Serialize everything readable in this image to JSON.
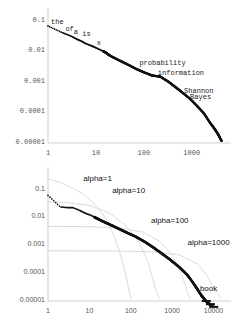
{
  "chart_data": [
    {
      "id": "top",
      "type": "scatter",
      "title": "",
      "xlabel": "",
      "ylabel": "",
      "xscale": "log",
      "yscale": "log",
      "xlim": [
        1,
        6000
      ],
      "ylim": [
        1e-05,
        0.2
      ],
      "grid": false,
      "legend": "none",
      "xticks": [
        "1",
        "10",
        "100",
        "1000"
      ],
      "xtick_values": [
        1,
        10,
        100,
        1000
      ],
      "yticks": [
        "0.1",
        "0.01",
        "0.001",
        "0.0001",
        "0.00001"
      ],
      "ytick_values": [
        0.1,
        0.01,
        0.001,
        0.0001,
        1e-05
      ],
      "series": [
        {
          "name": "word-frequency",
          "x": [
            1,
            2,
            3,
            4,
            5,
            6,
            8,
            10,
            13,
            16,
            20,
            30,
            45,
            70,
            100,
            150,
            220,
            320,
            450,
            600,
            900,
            1300,
            1800,
            2400,
            3000,
            3600,
            4200
          ],
          "values": [
            0.06,
            0.036,
            0.028,
            0.022,
            0.019,
            0.016,
            0.0135,
            0.0115,
            0.0095,
            0.008,
            0.0062,
            0.0045,
            0.0033,
            0.0023,
            0.0018,
            0.0014,
            0.0013,
            0.0009,
            0.0006,
            0.00042,
            0.00025,
            0.00014,
            8e-05,
            4e-05,
            2.5e-05,
            1.6e-05,
            1e-05
          ]
        }
      ],
      "annotations": [
        {
          "text": "the",
          "x": 1,
          "y": 0.062
        },
        {
          "text": "of",
          "x": 2,
          "y": 0.038
        },
        {
          "text": "a",
          "x": 3,
          "y": 0.03
        },
        {
          "text": "is",
          "x": 4.5,
          "y": 0.026
        },
        {
          "text": "x",
          "x": 9,
          "y": 0.013
        },
        {
          "text": "probability",
          "x": 70,
          "y": 0.0028
        },
        {
          "text": "information",
          "x": 170,
          "y": 0.0014
        },
        {
          "text": "Shannon",
          "x": 600,
          "y": 0.00035
        },
        {
          "text": "Bayes",
          "x": 800,
          "y": 0.00022
        }
      ]
    },
    {
      "id": "bottom",
      "type": "scatter",
      "title": "",
      "xlabel": "",
      "ylabel": "",
      "xscale": "log",
      "yscale": "log",
      "xlim": [
        1,
        20000
      ],
      "ylim": [
        1e-05,
        0.3
      ],
      "grid": false,
      "legend": "inline-annotations",
      "xticks": [
        "1",
        "10",
        "100",
        "1000",
        "10000"
      ],
      "xtick_values": [
        1,
        10,
        100,
        1000,
        10000
      ],
      "yticks": [
        "0.1",
        "0.01",
        "0.001",
        "0.0001",
        "0.00001"
      ],
      "ytick_values": [
        0.1,
        0.01,
        0.001,
        0.0001,
        1e-05
      ],
      "series": [
        {
          "name": "book",
          "x": [
            1,
            2,
            3,
            4,
            6,
            8,
            11,
            15,
            22,
            32,
            50,
            80,
            130,
            210,
            340,
            550,
            900,
            1500,
            2400,
            3600,
            5000,
            6500,
            8000,
            9500
          ],
          "values": [
            0.055,
            0.021,
            0.02,
            0.02,
            0.0155,
            0.0125,
            0.0105,
            0.0082,
            0.0062,
            0.0048,
            0.0035,
            0.0025,
            0.0018,
            0.0012,
            0.00075,
            0.00045,
            0.00026,
            0.00014,
            7e-05,
            3e-05,
            1.4e-05,
            8.5e-06,
            6.5e-06,
            5.5e-06
          ]
        },
        {
          "name": "alpha=1",
          "fit": true,
          "x": [
            1,
            2,
            4,
            8,
            15,
            25,
            40,
            60,
            80,
            95,
            105
          ],
          "values": [
            0.22,
            0.16,
            0.1,
            0.055,
            0.022,
            0.008,
            0.0018,
            0.0003,
            5e-05,
            1.5e-05,
            1e-05
          ]
        },
        {
          "name": "alpha=10",
          "fit": true,
          "x": [
            1,
            3,
            10,
            30,
            80,
            160,
            260,
            360,
            440,
            500
          ],
          "values": [
            0.032,
            0.03,
            0.024,
            0.013,
            0.0042,
            0.0011,
            0.00022,
            4e-05,
            1.4e-05,
            1e-05
          ]
        },
        {
          "name": "alpha=100",
          "fit": true,
          "x": [
            1,
            10,
            60,
            200,
            500,
            1000,
            1600,
            2100,
            2500,
            2800
          ],
          "values": [
            0.0042,
            0.0041,
            0.0036,
            0.0026,
            0.0012,
            0.0004,
            0.0001,
            3e-05,
            1.3e-05,
            1e-05
          ]
        },
        {
          "name": "alpha=1000",
          "fit": true,
          "x": [
            1,
            50,
            400,
            1500,
            4000,
            7000,
            10000,
            13000,
            15000,
            16000
          ],
          "values": [
            0.00055,
            0.00054,
            0.0005,
            0.00039,
            0.00019,
            7e-05,
            2.5e-05,
            1.5e-05,
            1.1e-05,
            1e-05
          ]
        }
      ],
      "annotations": [
        {
          "text": "alpha=1",
          "x": 6,
          "y": 0.16
        },
        {
          "text": "alpha=10",
          "x": 30,
          "y": 0.055
        },
        {
          "text": "alpha=100",
          "x": 260,
          "y": 0.0048
        },
        {
          "text": "alpha=1000",
          "x": 2000,
          "y": 0.00075
        },
        {
          "text": "book",
          "x": 11000,
          "y": 1.6e-05
        }
      ]
    }
  ]
}
